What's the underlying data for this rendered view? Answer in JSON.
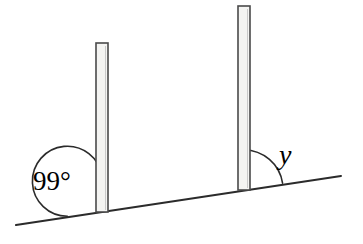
{
  "figure": {
    "kind": "geometry-diagram",
    "background_color": "#ffffff",
    "line_color": "#2b2b2b",
    "post_fill_color": "#f4f4f2",
    "post_edge_color": "#4a4a4a"
  },
  "ground": {
    "name": "sloped ground line",
    "left_point": {
      "x": 16,
      "y": 225
    },
    "right_point": {
      "x": 341,
      "y": 176
    }
  },
  "posts": [
    {
      "id": "left-post",
      "label": "left vertical post",
      "x": 96,
      "top_y": 43,
      "bottom_y": 212,
      "width": 12
    },
    {
      "id": "right-post",
      "label": "right vertical post",
      "x": 238,
      "top_y": 6,
      "bottom_y": 190,
      "width": 12
    }
  ],
  "angles": [
    {
      "id": "angle-99",
      "label": "99°",
      "value": "99",
      "unit": "degrees",
      "vertex": {
        "x": 102,
        "y": 211
      },
      "radius": 35,
      "opens": "left",
      "label_position": {
        "x": 33,
        "y": 190
      }
    },
    {
      "id": "angle-y",
      "label": "y",
      "value": "y",
      "unit": "unknown",
      "vertex": {
        "x": 244,
        "y": 189
      },
      "radius": 39,
      "opens": "right",
      "label_position": {
        "x": 279,
        "y": 164
      }
    }
  ]
}
